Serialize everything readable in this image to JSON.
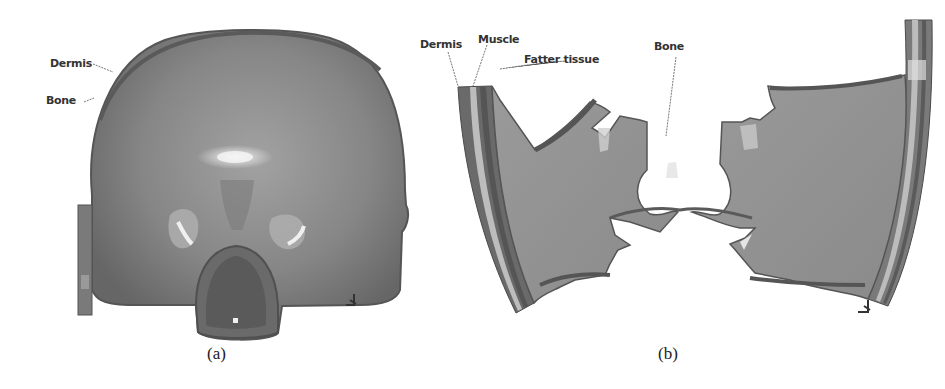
{
  "figure": {
    "panels": [
      {
        "id": "a",
        "caption": "(a)",
        "description": "Front view of finite-element head model (skull shell with eye sockets and nasal cavity)",
        "labels": [
          "Dermis",
          "Bone"
        ],
        "axis_triad": "y-axis indicator"
      },
      {
        "id": "b",
        "caption": "(b)",
        "description": "Sectioned head model showing layered tissue structure",
        "labels": [
          "Dermis",
          "Muscle",
          "Fatter tissue",
          "Bone"
        ],
        "axis_triad": "y-axis indicator"
      }
    ],
    "colors": {
      "surface": "#8a8a8a",
      "surface_dark": "#5e5e5e",
      "highlight": "#d8d8d8",
      "layer_light": "#b5b5b5",
      "text": "#333333"
    }
  }
}
